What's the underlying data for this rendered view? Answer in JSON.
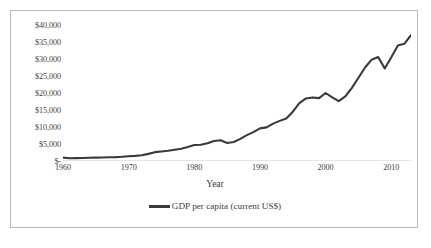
{
  "figure": {
    "background_color": "#ffffff",
    "border_color": "#b9b9b9",
    "line_color": "#3a3a3a",
    "axis_color": "#c8c8c8"
  },
  "axis": {
    "x_title": "Year",
    "y_tick_labels": [
      "$40,000",
      "$35,000",
      "$30,000",
      "$25,000",
      "$20,000",
      "$15,000",
      "$10,000",
      "$5,000",
      "$-"
    ],
    "x_tick_labels": [
      "1960",
      "1970",
      "1980",
      "1990",
      "2000",
      "2010"
    ]
  },
  "legend": {
    "marker_name": "line-swatch",
    "label": "GDP per capita (current US$)"
  },
  "chart_data": {
    "type": "line",
    "title": "",
    "subtitle": "",
    "xlabel": "Year",
    "ylabel": "",
    "xlim": [
      1960,
      2013
    ],
    "ylim": [
      0,
      40000
    ],
    "grid": false,
    "legend_position": "bottom",
    "y_ticks": [
      0,
      5000,
      10000,
      15000,
      20000,
      25000,
      30000,
      35000,
      40000
    ],
    "y_tick_labels": [
      "$-",
      "$5,000",
      "$10,000",
      "$15,000",
      "$20,000",
      "$25,000",
      "$30,000",
      "$35,000",
      "$40,000"
    ],
    "x_ticks": [
      1960,
      1970,
      1980,
      1990,
      2000,
      2010
    ],
    "series": [
      {
        "name": "GDP per capita (current US$)",
        "color": "#3a3a3a",
        "x": [
          1960,
          1961,
          1962,
          1963,
          1964,
          1965,
          1966,
          1967,
          1968,
          1969,
          1970,
          1971,
          1972,
          1973,
          1974,
          1975,
          1976,
          1977,
          1978,
          1979,
          1980,
          1981,
          1982,
          1983,
          1984,
          1985,
          1986,
          1987,
          1988,
          1989,
          1990,
          1991,
          1992,
          1993,
          1994,
          1995,
          1996,
          1997,
          1998,
          1999,
          2000,
          2001,
          2002,
          2003,
          2004,
          2005,
          2006,
          2007,
          2008,
          2009,
          2010,
          2011,
          2012,
          2013
        ],
        "values": [
          1000,
          800,
          850,
          900,
          950,
          1000,
          1050,
          1100,
          1150,
          1250,
          1400,
          1500,
          1700,
          2100,
          2600,
          2800,
          3000,
          3300,
          3600,
          4100,
          4700,
          4800,
          5200,
          5900,
          6100,
          5300,
          5600,
          6500,
          7600,
          8500,
          9600,
          9900,
          11000,
          11800,
          12500,
          14500,
          17000,
          18400,
          18700,
          18500,
          20000,
          18700,
          17600,
          19000,
          21500,
          24500,
          27500,
          29800,
          30600,
          27200,
          30500,
          34000,
          34500,
          37000
        ]
      }
    ],
    "annotations": []
  }
}
